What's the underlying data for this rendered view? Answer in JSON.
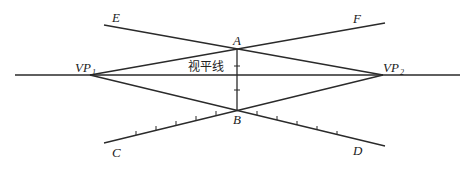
{
  "diagram": {
    "horizon_label": "视平线",
    "points": {
      "E": "E",
      "F": "F",
      "A": "A",
      "B": "B",
      "C": "C",
      "D": "D",
      "VP1_main": "VP",
      "VP1_sub": "1",
      "VP2_main": "VP",
      "VP2_sub": "2"
    },
    "colors": {
      "line": "#2a2a2a",
      "background": "#ffffff"
    }
  }
}
